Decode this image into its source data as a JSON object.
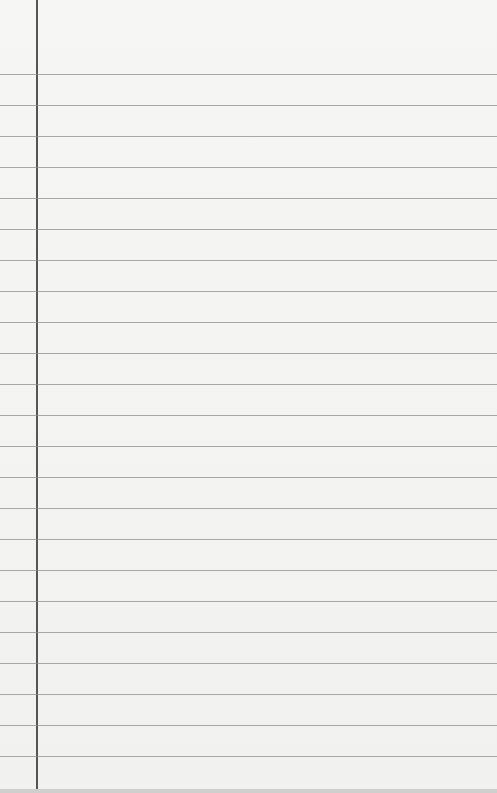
{
  "paper": {
    "type": "lined-paper",
    "rule_count": 23,
    "first_rule_y": 74,
    "rule_spacing": 31,
    "margin_x": 36,
    "colors": {
      "paper": "#f3f3f1",
      "rule": "#8d8d8b",
      "margin": "#555555"
    }
  }
}
